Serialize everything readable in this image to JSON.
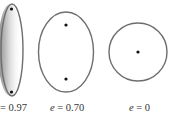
{
  "diagram": {
    "stroke_color": "#6e6e6e",
    "focus_color": "#111111",
    "shade_color": "#9a9a9a",
    "ellipses": [
      {
        "label_prefix": "",
        "label_text": "= 0.97",
        "eccentricity": 0.97,
        "cx": 10,
        "cy": 50,
        "rx": 12,
        "ry": 46,
        "foci": [
          [
            10,
            8
          ],
          [
            10,
            92
          ]
        ],
        "shaded_left": true
      },
      {
        "label_prefix": "e",
        "label_text": " = 0.70",
        "eccentricity": 0.7,
        "cx": 66,
        "cy": 52,
        "rx": 28,
        "ry": 40,
        "foci": [
          [
            66,
            25
          ],
          [
            66,
            79
          ]
        ],
        "shaded_left": false
      },
      {
        "label_prefix": "e",
        "label_text": " = 0",
        "eccentricity": 0,
        "cx": 138,
        "cy": 52,
        "rx": 29,
        "ry": 29,
        "foci": [
          [
            138,
            52
          ]
        ],
        "shaded_left": false
      }
    ]
  }
}
